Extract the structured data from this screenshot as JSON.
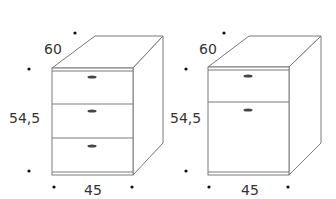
{
  "colors": {
    "line": "#7a7a7a",
    "dark_line": "#555555",
    "text": "#333333",
    "dot": "#111111",
    "background": "#ffffff"
  },
  "cabinets": [
    {
      "id": "three-drawer-pedestal",
      "depth_label": "60",
      "height_label": "54,5",
      "width_label": "45",
      "drawers": 3,
      "handles": 3
    },
    {
      "id": "drawer-and-door-pedestal",
      "depth_label": "60",
      "height_label": "54,5",
      "width_label": "45",
      "drawers": 1,
      "doors": 1,
      "handles": 2
    }
  ]
}
